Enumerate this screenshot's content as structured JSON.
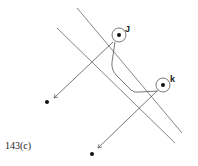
{
  "figure": {
    "label": "143(c)",
    "nodes": [
      {
        "id": "J",
        "label": "J",
        "x": 119,
        "y": 35
      },
      {
        "id": "K",
        "label": "k",
        "x": 163,
        "y": 85
      }
    ],
    "endpoints": [
      {
        "x": 47,
        "y": 102
      },
      {
        "x": 92,
        "y": 154
      }
    ],
    "colors": {
      "stroke": "#555555",
      "dot": "#111111"
    }
  }
}
